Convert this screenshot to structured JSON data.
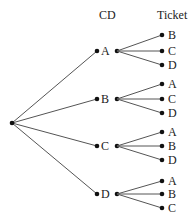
{
  "headers": {
    "cd": "CD",
    "ticket": "Ticket"
  },
  "root": {
    "x": 12,
    "y": 123
  },
  "colors": {
    "line": "#555555",
    "dot": "#111111",
    "text": "#222222"
  },
  "branches": [
    {
      "label": "A",
      "y": 51,
      "children": [
        {
          "label": "B",
          "y": 35
        },
        {
          "label": "C",
          "y": 51
        },
        {
          "label": "D",
          "y": 65
        }
      ]
    },
    {
      "label": "B",
      "y": 99,
      "children": [
        {
          "label": "A",
          "y": 84
        },
        {
          "label": "C",
          "y": 99
        },
        {
          "label": "D",
          "y": 113
        }
      ]
    },
    {
      "label": "C",
      "y": 146,
      "children": [
        {
          "label": "A",
          "y": 132
        },
        {
          "label": "B",
          "y": 146
        },
        {
          "label": "D",
          "y": 160
        }
      ]
    },
    {
      "label": "D",
      "y": 194,
      "children": [
        {
          "label": "A",
          "y": 181
        },
        {
          "label": "B",
          "y": 194
        },
        {
          "label": "C",
          "y": 208
        }
      ]
    }
  ]
}
